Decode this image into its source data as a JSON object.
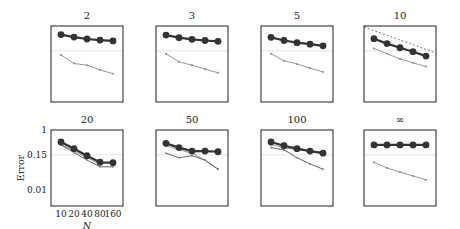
{
  "chart_data": {
    "type": "line",
    "title": "",
    "xlabel": "N",
    "ylabel": "Error",
    "yscale": "log",
    "ylim": [
      0.003,
      1
    ],
    "yticks": [
      {
        "value": 1,
        "label": "1"
      },
      {
        "value": 0.15,
        "label": "0.15"
      },
      {
        "value": 0.01,
        "label": "0.01"
      }
    ],
    "x": [
      10,
      20,
      40,
      80,
      160
    ],
    "xtick_labels": [
      "10",
      "20",
      "40",
      "80",
      "160"
    ],
    "reference_level": 0.15,
    "grid": false,
    "legend": null,
    "panels": [
      {
        "title": "2",
        "series": [
          {
            "name": "main (large markers)",
            "values": [
              0.52,
              0.43,
              0.37,
              0.34,
              0.32
            ]
          },
          {
            "name": "secondary (thin)",
            "values": [
              0.11,
              0.057,
              0.05,
              0.035,
              0.026
            ]
          }
        ]
      },
      {
        "title": "3",
        "series": [
          {
            "name": "main (large markers)",
            "values": [
              0.5,
              0.41,
              0.36,
              0.33,
              0.31
            ]
          },
          {
            "name": "secondary (thin)",
            "values": [
              0.12,
              0.065,
              0.05,
              0.037,
              0.028
            ]
          }
        ]
      },
      {
        "title": "5",
        "series": [
          {
            "name": "main (large markers)",
            "values": [
              0.42,
              0.33,
              0.28,
              0.25,
              0.22
            ]
          },
          {
            "name": "secondary (thin)",
            "values": [
              0.12,
              0.07,
              0.055,
              0.04,
              0.03
            ]
          }
        ]
      },
      {
        "title": "10",
        "series": [
          {
            "name": "main (large markers)",
            "values": [
              0.38,
              0.26,
              0.19,
              0.14,
              0.1
            ]
          },
          {
            "name": "secondary (thin)",
            "values": [
              0.18,
              0.12,
              0.08,
              0.06,
              0.045
            ]
          },
          {
            "name": "reference slope (dashed)",
            "values": [
              0.95,
              0.62,
              0.4,
              0.27,
              0.18
            ]
          }
        ]
      },
      {
        "title": "20",
        "series": [
          {
            "name": "main (large markers)",
            "values": [
              0.4,
              0.24,
              0.14,
              0.085,
              0.082
            ]
          },
          {
            "name": "secondary (thin)",
            "values": [
              0.34,
              0.2,
              0.12,
              0.075,
              0.082
            ]
          },
          {
            "name": "tertiary (thin)",
            "values": [
              0.32,
              0.18,
              0.1,
              0.06,
              0.06
            ]
          }
        ]
      },
      {
        "title": "50",
        "series": [
          {
            "name": "main (large markers)",
            "values": [
              0.36,
              0.26,
              0.2,
              0.2,
              0.19
            ]
          },
          {
            "name": "secondary (thin)",
            "values": [
              0.3,
              0.22,
              0.17,
              0.1,
              0.05
            ]
          },
          {
            "name": "tertiary (thin)",
            "values": [
              0.17,
              0.12,
              0.14,
              0.1,
              0.05
            ]
          }
        ]
      },
      {
        "title": "100",
        "series": [
          {
            "name": "main (large markers)",
            "values": [
              0.4,
              0.3,
              0.24,
              0.2,
              0.17
            ]
          },
          {
            "name": "secondary (thin)",
            "values": [
              0.33,
              0.26,
              0.22,
              0.2,
              0.18
            ]
          },
          {
            "name": "tertiary (thin)",
            "values": [
              0.26,
              0.22,
              0.12,
              0.075,
              0.05
            ]
          }
        ]
      },
      {
        "title": "∞",
        "series": [
          {
            "name": "main (large markers)",
            "values": [
              0.32,
              0.32,
              0.32,
              0.32,
              0.32
            ]
          },
          {
            "name": "secondary (thin)",
            "values": [
              0.085,
              0.055,
              0.04,
              0.03,
              0.022
            ]
          }
        ]
      }
    ]
  },
  "colors": {
    "main_line": "#333333",
    "main_marker": "#333333",
    "secondary_line": "#8a8a8a",
    "tertiary_line": "#555555",
    "reference_line": "#e6e6e6",
    "frame": "#333333"
  }
}
